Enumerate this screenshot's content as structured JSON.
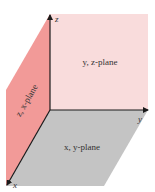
{
  "diagram": {
    "planes": [
      {
        "id": "yz",
        "label": "y, z-plane",
        "color": "#f9dcdc"
      },
      {
        "id": "xy",
        "label": "x, y-plane",
        "color": "#c4c4c4"
      },
      {
        "id": "zx",
        "label": "z, x-plane",
        "color": "#f29a98"
      }
    ],
    "axes": [
      {
        "id": "z",
        "label": "z"
      },
      {
        "id": "y",
        "label": "y"
      },
      {
        "id": "x",
        "label": "x"
      }
    ],
    "colors": {
      "axis": "#1a1a1a"
    }
  }
}
